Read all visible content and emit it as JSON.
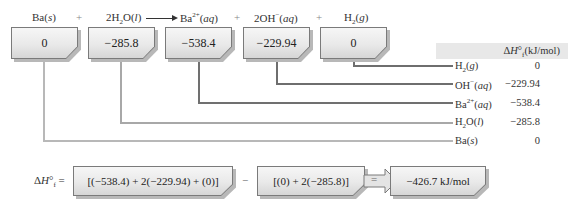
{
  "reaction": {
    "terms": [
      {
        "formula": "Ba",
        "state": "s"
      },
      {
        "operator": "+"
      },
      {
        "coefficient": "2",
        "formula": "H2O",
        "state": "l"
      },
      {
        "arrow": "⟶"
      },
      {
        "formula": "Ba2+",
        "state": "aq"
      },
      {
        "operator": "+"
      },
      {
        "coefficient": "2",
        "formula": "OH−",
        "state": "aq"
      },
      {
        "operator": "+"
      },
      {
        "formula": "H2",
        "state": "g"
      }
    ]
  },
  "boxes": [
    {
      "species": "Ba(s)",
      "value": "0"
    },
    {
      "species": "H2O(l)",
      "value": "−285.8"
    },
    {
      "species": "Ba2+(aq)",
      "value": "−538.4"
    },
    {
      "species": "OH−(aq)",
      "value": "−229.94"
    },
    {
      "species": "H2(g)",
      "value": "0"
    }
  ],
  "table": {
    "header": "ΔH°f(kJ/mol)",
    "rows": [
      {
        "species": "H2(g)",
        "value": "0"
      },
      {
        "species": "OH−(aq)",
        "value": "−229.94"
      },
      {
        "species": "Ba2+(aq)",
        "value": "−538.4"
      },
      {
        "species": "H2O(l)",
        "value": "−285.8"
      },
      {
        "species": "Ba(s)",
        "value": "0"
      }
    ]
  },
  "calculation": {
    "lhs": "ΔH°f =",
    "products_sum": "[(−538.4) + 2(−229.94) + (0)]",
    "minus": "−",
    "reactants_sum": "[(0) + 2(−285.8)]",
    "equals": "=",
    "result": "−426.7 kJ/mol"
  },
  "colors": {
    "line_light": "#b5b5b5",
    "line_mid": "#9a9a9a",
    "line_dark": "#6e6e6e",
    "header_band": "#e8e8e8"
  }
}
